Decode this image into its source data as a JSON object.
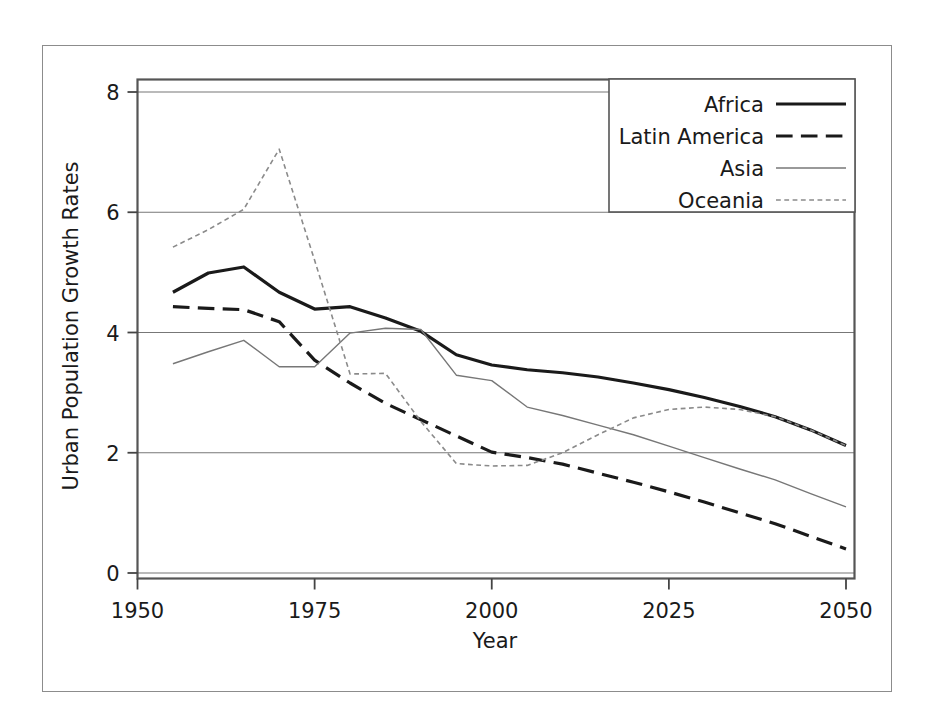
{
  "chart_data": {
    "type": "line",
    "title": "",
    "xlabel": "Year",
    "ylabel": "Urban Population Growth Rates",
    "xlim": [
      1950,
      2050
    ],
    "ylim": [
      0,
      8.2
    ],
    "grid": true,
    "grid_axis": "y",
    "legend_position": "top-right",
    "xticks": [
      1950,
      1975,
      2000,
      2025,
      2050
    ],
    "xtick_labels": [
      "1950",
      "1975",
      "2000",
      "2025",
      "2050"
    ],
    "yticks": [
      0,
      2,
      4,
      6,
      8
    ],
    "ytick_labels": [
      "0",
      "2",
      "4",
      "6",
      "8"
    ],
    "x": [
      1955,
      1960,
      1965,
      1970,
      1975,
      1980,
      1985,
      1990,
      1995,
      2000,
      2005,
      2010,
      2015,
      2020,
      2025,
      2030,
      2035,
      2040,
      2045,
      2050
    ],
    "series": [
      {
        "name": "Africa",
        "style": "solid",
        "width": 3.2,
        "color": "#1a1a1a",
        "values": [
          4.67,
          4.99,
          5.09,
          4.67,
          4.39,
          4.43,
          4.24,
          4.02,
          3.63,
          3.46,
          3.38,
          3.33,
          3.26,
          3.16,
          3.05,
          2.92,
          2.77,
          2.6,
          2.38,
          2.12
        ]
      },
      {
        "name": "Latin America",
        "style": "dashed",
        "width": 3.2,
        "color": "#1a1a1a",
        "values": [
          4.43,
          4.4,
          4.38,
          4.18,
          3.54,
          3.16,
          2.82,
          2.55,
          2.28,
          2.01,
          1.92,
          1.81,
          1.66,
          1.51,
          1.35,
          1.18,
          1.0,
          0.82,
          0.61,
          0.4
        ]
      },
      {
        "name": "Asia",
        "style": "solid",
        "width": 1.4,
        "color": "#777777",
        "values": [
          3.48,
          3.68,
          3.87,
          3.43,
          3.43,
          3.99,
          4.07,
          4.05,
          3.29,
          3.2,
          2.76,
          2.62,
          2.46,
          2.3,
          2.11,
          1.92,
          1.73,
          1.55,
          1.32,
          1.1
        ]
      },
      {
        "name": "Oceania",
        "style": "dotted",
        "width": 1.6,
        "color": "#8a8a8a",
        "values": [
          5.42,
          5.71,
          6.05,
          7.05,
          5.2,
          3.31,
          3.32,
          2.52,
          1.82,
          1.78,
          1.79,
          2.0,
          2.3,
          2.58,
          2.72,
          2.76,
          2.72,
          2.6,
          2.38,
          2.12
        ]
      }
    ]
  },
  "legend": {
    "items": [
      {
        "label": "Africa"
      },
      {
        "label": "Latin America"
      },
      {
        "label": "Asia"
      },
      {
        "label": "Oceania"
      }
    ]
  },
  "colors": {
    "plot_frame": "#555555",
    "outer_frame": "#8c8c8c",
    "gridline": "#777777",
    "background": "#ffffff"
  }
}
